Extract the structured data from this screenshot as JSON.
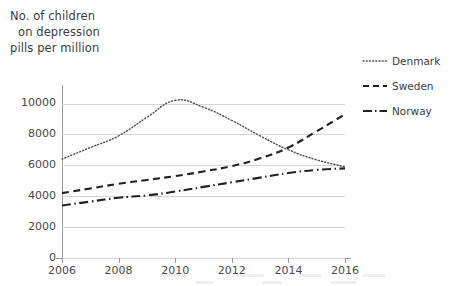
{
  "chart_data": {
    "type": "line",
    "title": "No. of children on depression pills per million",
    "title_lines": [
      "No. of children",
      "on depression",
      "pills per million"
    ],
    "xlabel": "",
    "ylabel": "",
    "x": [
      2006,
      2007,
      2008,
      2009,
      2010,
      2011,
      2012,
      2013,
      2014,
      2015,
      2016
    ],
    "categories": [
      "2006",
      "2007",
      "2008",
      "2009",
      "2010",
      "2011",
      "2012",
      "2013",
      "2014",
      "2015",
      "2016"
    ],
    "xlim": [
      2006,
      2016
    ],
    "ylim": [
      0,
      11000
    ],
    "xticks": [
      2006,
      2008,
      2010,
      2012,
      2014,
      2016
    ],
    "xtick_labels": [
      "2006",
      "2008",
      "2010",
      "2012",
      "2014",
      "2016"
    ],
    "yticks": [
      0,
      2000,
      4000,
      6000,
      8000,
      10000
    ],
    "ytick_labels": [
      "0",
      "2000",
      "4000",
      "6000",
      "8000",
      "10000"
    ],
    "grid": true,
    "grid_axis": "y",
    "legend_position": "right",
    "series": [
      {
        "name": "Denmark",
        "line_style": "dotted",
        "color": "#555555",
        "values": [
          6400,
          7150,
          7900,
          9100,
          10200,
          9750,
          8900,
          7900,
          7000,
          6350,
          5900
        ]
      },
      {
        "name": "Sweden",
        "line_style": "dashed",
        "color": "#222222",
        "values": [
          4200,
          4500,
          4800,
          5050,
          5300,
          5600,
          5950,
          6450,
          7150,
          8200,
          9300
        ]
      },
      {
        "name": "Norway",
        "line_style": "dash-dot",
        "color": "#222222",
        "values": [
          3400,
          3650,
          3900,
          4050,
          4300,
          4600,
          4900,
          5200,
          5500,
          5700,
          5800
        ]
      }
    ]
  },
  "legend": {
    "items": [
      {
        "label": "Denmark",
        "style": "dotted"
      },
      {
        "label": "Sweden",
        "style": "dashed"
      },
      {
        "label": "Norway",
        "style": "dash-dot"
      }
    ]
  }
}
